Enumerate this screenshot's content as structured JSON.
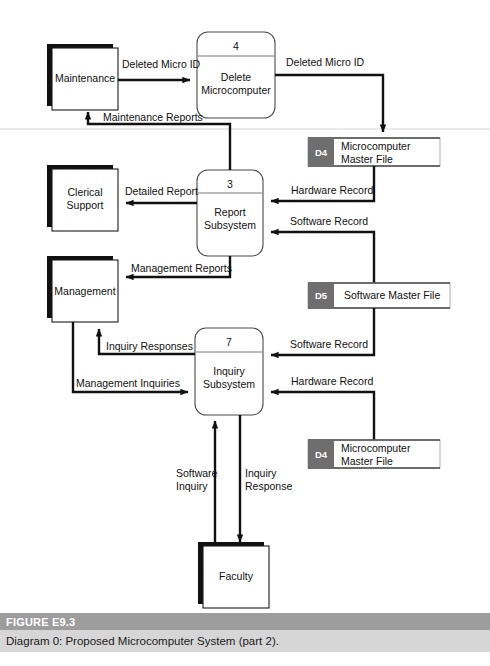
{
  "figure": {
    "number": "FIGURE E9.3",
    "caption": "Diagram 0: Proposed Microcomputer System (part 2)."
  },
  "entities": [
    {
      "id": "maintenance",
      "label": "Maintenance"
    },
    {
      "id": "clerical-support",
      "label_line1": "Clerical",
      "label_line2": "Support"
    },
    {
      "id": "management",
      "label": "Management"
    },
    {
      "id": "faculty",
      "label": "Faculty"
    }
  ],
  "processes": [
    {
      "id": "delete-microcomputer",
      "number": "4",
      "label_line1": "Delete",
      "label_line2": "Microcomputer"
    },
    {
      "id": "report-subsystem",
      "number": "3",
      "label_line1": "Report",
      "label_line2": "Subsystem"
    },
    {
      "id": "inquiry-subsystem",
      "number": "7",
      "label_line1": "Inquiry",
      "label_line2": "Subsystem"
    }
  ],
  "data_stores": [
    {
      "id": "d4-top",
      "code": "D4",
      "label_line1": "Microcomputer",
      "label_line2": "Master File"
    },
    {
      "id": "d5",
      "code": "D5",
      "label_line1": "Software Master File",
      "label_line2": ""
    },
    {
      "id": "d4-bottom",
      "code": "D4",
      "label_line1": "Microcomputer",
      "label_line2": "Master File"
    }
  ],
  "flows": [
    {
      "id": "deleted-micro-id-in",
      "label": "Deleted Micro ID"
    },
    {
      "id": "deleted-micro-id-out",
      "label": "Deleted Micro ID"
    },
    {
      "id": "maintenance-reports",
      "label": "Maintenance Reports"
    },
    {
      "id": "detailed-report",
      "label": "Detailed Report"
    },
    {
      "id": "hardware-record-top",
      "label": "Hardware Record"
    },
    {
      "id": "software-record-top",
      "label": "Software Record"
    },
    {
      "id": "management-reports",
      "label": "Management Reports"
    },
    {
      "id": "inquiry-responses",
      "label": "Inquiry Responses"
    },
    {
      "id": "management-inquiries",
      "label": "Management Inquiries"
    },
    {
      "id": "software-record-bottom",
      "label": "Software Record"
    },
    {
      "id": "hardware-record-bottom",
      "label": "Hardware Record"
    },
    {
      "id": "software-inquiry",
      "label_line1": "Software",
      "label_line2": "Inquiry"
    },
    {
      "id": "inquiry-response",
      "label_line1": "Inquiry",
      "label_line2": "Response"
    }
  ],
  "colors": {
    "ink": "#111111",
    "store_id_bg": "#6e6e6e",
    "caption_title_bg": "#9d9d9d",
    "caption_sub_bg": "#d6d6d6",
    "page": "#ffffff"
  }
}
